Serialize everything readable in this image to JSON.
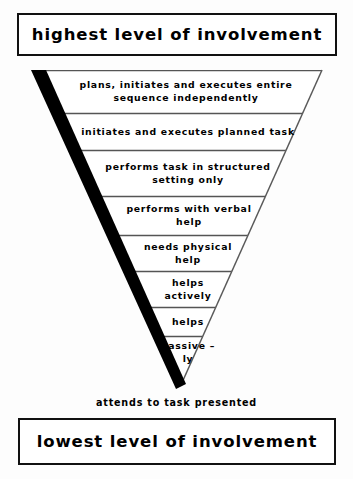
{
  "banners": {
    "top": "highest level of involvement",
    "bottom": "lowest level of involvement"
  },
  "apex_caption": "attends to task presented",
  "diagram": {
    "shape": "inverted-triangle",
    "left_edge_style": "thick-black-bar",
    "right_edge_style": "thin-line",
    "fill": "#ffffff",
    "stroke": "#4a4a4a",
    "accent": "#000000"
  },
  "tiers": [
    {
      "index": 1,
      "label": "plans, initiates and executes entire\nsequence independently"
    },
    {
      "index": 2,
      "label": "initiates and executes planned task"
    },
    {
      "index": 3,
      "label": "performs task in structured\nsetting only"
    },
    {
      "index": 4,
      "label": "performs with verbal\nhelp"
    },
    {
      "index": 5,
      "label": "needs physical\nhelp"
    },
    {
      "index": 6,
      "label": "helps\nactively"
    },
    {
      "index": 7,
      "label": "helps"
    },
    {
      "index": 8,
      "label": "passive –\nly"
    }
  ]
}
